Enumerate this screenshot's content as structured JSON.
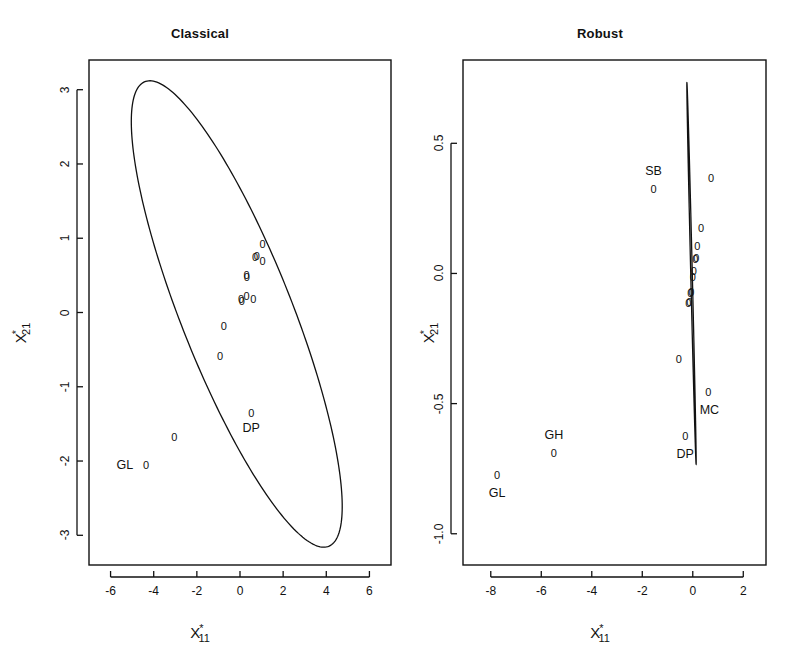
{
  "figure": {
    "background": "#ffffff",
    "ink_color": "#111111",
    "width": 801,
    "height": 665
  },
  "panels": [
    {
      "id": "classical",
      "title": "Classical",
      "xlabel_base": "X",
      "xlabel_star": "*",
      "xlabel_sub": "11",
      "ylabel_base": "X",
      "ylabel_star": "*",
      "ylabel_sub": "21",
      "xticks": [
        "-6",
        "-4",
        "-2",
        "0",
        "2",
        "4",
        "6"
      ],
      "xtick_values": [
        -6,
        -4,
        -2,
        0,
        2,
        4,
        6
      ],
      "yticks": [
        "3",
        "2",
        "1",
        "0",
        "-1",
        "-2",
        "-3"
      ],
      "ytick_values": [
        3,
        2,
        1,
        0,
        -1,
        -2,
        -3
      ],
      "xlim": [
        -7.0,
        7.0
      ],
      "ylim": [
        -3.4,
        3.4
      ]
    },
    {
      "id": "robust",
      "title": "Robust",
      "xlabel_base": "X",
      "xlabel_star": "*",
      "xlabel_sub": "11",
      "ylabel_base": "X",
      "ylabel_star": "*",
      "ylabel_sub": "21",
      "xticks": [
        "-8",
        "-6",
        "-4",
        "-2",
        "0",
        "2"
      ],
      "xtick_values": [
        -8,
        -6,
        -4,
        -2,
        0,
        2
      ],
      "yticks": [
        "0.5",
        "0.0",
        "-0.5",
        "-1.0"
      ],
      "ytick_values": [
        0.5,
        0.0,
        -0.5,
        -1.0
      ],
      "xlim": [
        -9.1,
        2.9
      ],
      "ylim": [
        -1.12,
        0.82
      ]
    }
  ],
  "chart_data": [
    {
      "type": "scatter",
      "panel": "classical",
      "title": "Classical",
      "xlabel": "X*11",
      "ylabel": "X*21",
      "xlim": [
        -7.0,
        7.0
      ],
      "ylim": [
        -3.4,
        3.4
      ],
      "xticks": [
        -6,
        -4,
        -2,
        0,
        2,
        4,
        6
      ],
      "yticks": [
        3,
        2,
        1,
        0,
        -1,
        -2,
        -3
      ],
      "grid": false,
      "legend": "none",
      "marker": "0",
      "points": [
        {
          "x": 1.05,
          "y": 0.92,
          "label": ""
        },
        {
          "x": 0.7,
          "y": 0.75,
          "label": ""
        },
        {
          "x": 0.78,
          "y": 0.76,
          "label": ""
        },
        {
          "x": 1.05,
          "y": 0.7,
          "label": ""
        },
        {
          "x": 0.3,
          "y": 0.5,
          "label": ""
        },
        {
          "x": 0.32,
          "y": 0.48,
          "label": ""
        },
        {
          "x": 0.05,
          "y": 0.18,
          "label": ""
        },
        {
          "x": 0.08,
          "y": 0.15,
          "label": ""
        },
        {
          "x": 0.3,
          "y": 0.22,
          "label": ""
        },
        {
          "x": 0.62,
          "y": 0.18,
          "label": ""
        },
        {
          "x": -0.75,
          "y": -0.18,
          "label": ""
        },
        {
          "x": -0.92,
          "y": -0.58,
          "label": ""
        },
        {
          "x": 0.52,
          "y": -1.35,
          "label": "DP"
        },
        {
          "x": -3.05,
          "y": -1.68,
          "label": ""
        },
        {
          "x": -4.35,
          "y": -2.05,
          "label": "GL"
        }
      ],
      "annotations": [
        {
          "text": "DP",
          "x": 0.52,
          "y": -1.55,
          "anchor": "center"
        },
        {
          "text": "GL",
          "x": -4.95,
          "y": -2.05,
          "anchor": "right"
        }
      ],
      "ellipse": {
        "kind": "tolerance-ellipse",
        "center_x": -0.15,
        "center_y": -0.02,
        "semi_major": 5.6,
        "semi_minor": 1.55,
        "angle_deg": -30.5
      }
    },
    {
      "type": "scatter",
      "panel": "robust",
      "title": "Robust",
      "xlabel": "X*11",
      "ylabel": "X*21",
      "xlim": [
        -9.1,
        2.9
      ],
      "ylim": [
        -1.12,
        0.82
      ],
      "xticks": [
        -8,
        -6,
        -4,
        -2,
        0,
        2
      ],
      "yticks": [
        0.5,
        0.0,
        -0.5,
        -1.0
      ],
      "grid": false,
      "legend": "none",
      "marker": "0",
      "points": [
        {
          "x": 0.72,
          "y": 0.365,
          "label": ""
        },
        {
          "x": 0.33,
          "y": 0.175,
          "label": ""
        },
        {
          "x": 0.18,
          "y": 0.105,
          "label": ""
        },
        {
          "x": 0.1,
          "y": 0.055,
          "label": ""
        },
        {
          "x": 0.14,
          "y": 0.06,
          "label": ""
        },
        {
          "x": 0.04,
          "y": 0.01,
          "label": ""
        },
        {
          "x": 0.0,
          "y": -0.015,
          "label": ""
        },
        {
          "x": -0.1,
          "y": -0.075,
          "label": ""
        },
        {
          "x": -0.06,
          "y": -0.07,
          "label": ""
        },
        {
          "x": -0.14,
          "y": -0.11,
          "label": ""
        },
        {
          "x": -0.18,
          "y": -0.115,
          "label": ""
        },
        {
          "x": -0.55,
          "y": -0.33,
          "label": ""
        },
        {
          "x": -1.55,
          "y": 0.325,
          "label": "SB"
        },
        {
          "x": 0.62,
          "y": -0.455,
          "label": "MC"
        },
        {
          "x": -0.3,
          "y": -0.625,
          "label": "DP"
        },
        {
          "x": -5.5,
          "y": -0.69,
          "label": "GH"
        },
        {
          "x": -7.75,
          "y": -0.775,
          "label": "GL"
        }
      ],
      "annotations": [
        {
          "text": "SB",
          "x": -1.55,
          "y": 0.395,
          "anchor": "center"
        },
        {
          "text": "MC",
          "x": 0.66,
          "y": -0.525,
          "anchor": "center"
        },
        {
          "text": "DP",
          "x": -0.3,
          "y": -0.695,
          "anchor": "center"
        },
        {
          "text": "GH",
          "x": -5.5,
          "y": -0.62,
          "anchor": "center"
        },
        {
          "text": "GL",
          "x": -7.75,
          "y": -0.845,
          "anchor": "center"
        }
      ],
      "ellipse": {
        "kind": "tolerance-ellipse",
        "center_x": -0.05,
        "center_y": 0.0,
        "semi_major": 0.755,
        "semi_minor": 0.03,
        "angle_deg": -76.0,
        "semi_major_x_units": 1.62
      }
    }
  ]
}
